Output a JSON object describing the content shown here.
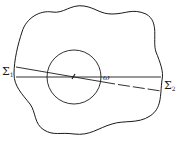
{
  "diagram": {
    "labels": {
      "sigma1": {
        "symbol": "Σ",
        "sub": "1"
      },
      "sigma2": {
        "symbol": "Σ",
        "sub": "2"
      },
      "omega": "ω"
    },
    "colors": {
      "stroke": "#1a1a1a",
      "background": "#ffffff"
    }
  }
}
